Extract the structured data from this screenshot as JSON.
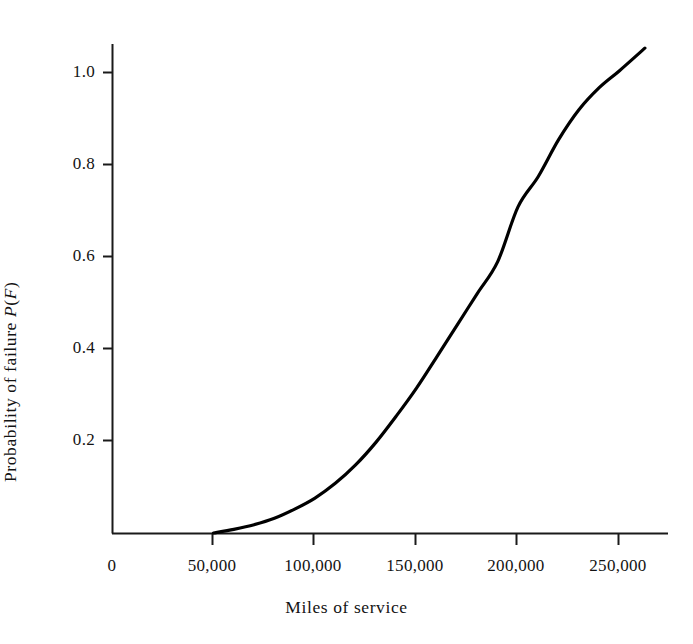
{
  "chart_data": {
    "type": "line",
    "title": "",
    "subtitle": "",
    "xlabel": "Miles of service",
    "ylabel": "Probability of failure P(F)",
    "ylabel_parts": {
      "lead": "Probability of failure ",
      "italic_p": "P",
      "paren_open": "(",
      "italic_f": "F",
      "paren_close": ")"
    },
    "xlim": [
      0,
      265000
    ],
    "ylim": [
      0,
      1.08
    ],
    "grid": false,
    "legend": null,
    "xticks": [
      0,
      50000,
      100000,
      150000,
      200000,
      250000
    ],
    "xtick_labels": [
      "0",
      "50,000",
      "100,000",
      "150,000",
      "200,000",
      "250,000"
    ],
    "yticks": [
      0.2,
      0.4,
      0.6,
      0.8,
      1.0
    ],
    "ytick_labels": [
      "0.2",
      "0.4",
      "0.6",
      "0.8",
      "1.0"
    ],
    "series": [
      {
        "name": "Probability of failure",
        "x": [
          50000,
          60000,
          70000,
          80000,
          90000,
          100000,
          110000,
          120000,
          130000,
          140000,
          150000,
          160000,
          170000,
          180000,
          190000,
          200000,
          210000,
          220000,
          230000,
          240000,
          250000,
          262500
        ],
        "y": [
          0.0,
          0.008,
          0.018,
          0.032,
          0.052,
          0.076,
          0.108,
          0.148,
          0.197,
          0.254,
          0.315,
          0.383,
          0.452,
          0.521,
          0.59,
          0.709,
          0.775,
          0.855,
          0.92,
          0.968,
          1.005,
          1.054
        ]
      }
    ],
    "curve_shape": "sigmoid ogive, flat until 50,000 miles then rising to just above 1.0 at ~262,500 miles",
    "line_color": "#000000",
    "line_width": 3.2,
    "axis_color": "#1a1a1a",
    "background_color": "#ffffff"
  },
  "axes_geometry": {
    "origin_x_px": 112,
    "origin_y_px": 533,
    "px_per_50000_miles": 101.5,
    "px_per_unit_probability": 460
  }
}
